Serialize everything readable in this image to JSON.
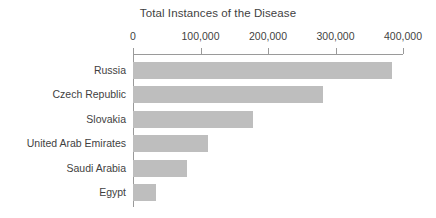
{
  "chart_data": {
    "type": "bar",
    "orientation": "horizontal",
    "title": "Total Instances of the Disease",
    "xlabel": "",
    "ylabel": "",
    "categories": [
      "Russia",
      "Czech Republic",
      "Slovakia",
      "United Arab Emirates",
      "Saudi Arabia",
      "Egypt"
    ],
    "values": [
      384000,
      281000,
      178000,
      111000,
      80000,
      34000
    ],
    "xlim": [
      0,
      400000
    ],
    "xticks": [
      0,
      100000,
      200000,
      300000,
      400000
    ],
    "xtick_labels": [
      "0",
      "100,000",
      "200,000",
      "300,000",
      "400,000"
    ],
    "axis_position": "top",
    "grid": false,
    "legend": null,
    "bar_color": "#bebebe",
    "text_color": "#3f3f3f",
    "axis_color": "#9a9a9a",
    "background": "#ffffff"
  }
}
